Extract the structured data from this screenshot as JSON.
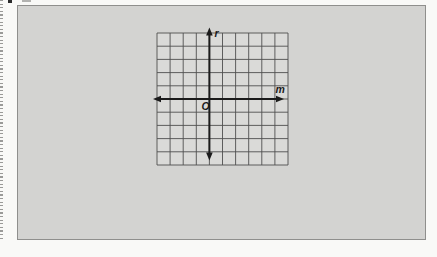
{
  "figure": {
    "type": "coordinate-grid",
    "y_axis_label": "r",
    "x_axis_label": "m",
    "origin_label": "O",
    "grid": {
      "columns": 10,
      "rows": 10,
      "cols_left_of_y_axis": 4,
      "cols_right_of_y_axis": 6,
      "rows_above_x_axis": 5,
      "rows_below_x_axis": 5
    },
    "colors": {
      "page_background": "#f9f9f7",
      "panel_background": "#d3d3d1",
      "panel_border": "#8f8f8d",
      "grid_background": "#dadad8",
      "grid_line": "#4f4f4f",
      "axis": "#1b1b1b",
      "label": "#1b1b1b"
    }
  }
}
